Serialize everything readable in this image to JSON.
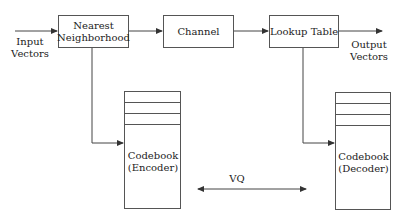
{
  "diagram": {
    "input_label": [
      "Input",
      "Vectors"
    ],
    "output_label": [
      "Output",
      "Vectors"
    ],
    "nodes": {
      "nearest": [
        "Nearest",
        "Neighborhood"
      ],
      "channel": "Channel",
      "lookup": "Lookup Table",
      "encoder": [
        "Codebook",
        "(Encoder)"
      ],
      "decoder": [
        "Codebook",
        "(Decoder)"
      ]
    },
    "vq_label": "VQ",
    "colors": {
      "line": "#444444",
      "text": "#222222"
    }
  }
}
